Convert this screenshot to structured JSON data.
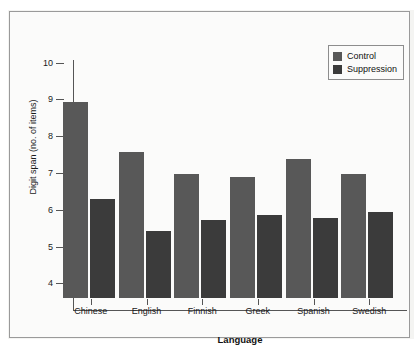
{
  "chart_data": {
    "type": "bar",
    "title": "",
    "xlabel": "Language",
    "ylabel": "Digit span (no. of items)",
    "categories": [
      "Chinese",
      "English",
      "Finnish",
      "Greek",
      "Spanish",
      "Swedish"
    ],
    "series": [
      {
        "name": "Control",
        "color": "#585858",
        "values": [
          8.94,
          7.58,
          6.97,
          6.88,
          7.38,
          6.97
        ]
      },
      {
        "name": "Suppression",
        "color": "#3b3b3b",
        "values": [
          6.28,
          5.43,
          5.72,
          5.87,
          5.78,
          5.95
        ]
      }
    ],
    "ylim": [
      3.6,
      10.4
    ],
    "yticks": [
      4,
      5,
      6,
      7,
      8,
      9,
      10
    ],
    "ytick_labels": [
      "4",
      "5",
      "6",
      "7",
      "8",
      "9",
      "10"
    ],
    "grid": false,
    "legend_position": "top-right"
  },
  "legend": {
    "entries": [
      {
        "label": "Control"
      },
      {
        "label": "Suppression"
      }
    ]
  },
  "axes": {
    "y_title": "Digit span (no. of items)",
    "x_title": "Language"
  }
}
